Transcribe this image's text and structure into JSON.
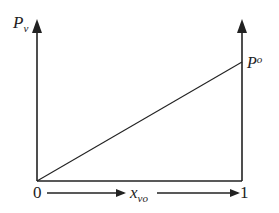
{
  "diagram": {
    "y_axis_label": "P",
    "y_axis_label_sub": "v",
    "line_end_label": "P",
    "line_end_label_sup": "o",
    "x_start_label": "0",
    "x_end_label": "1",
    "x_axis_label": "x",
    "x_axis_label_sub": "vo",
    "colors": {
      "line": "#222222",
      "background": "#ffffff"
    }
  }
}
